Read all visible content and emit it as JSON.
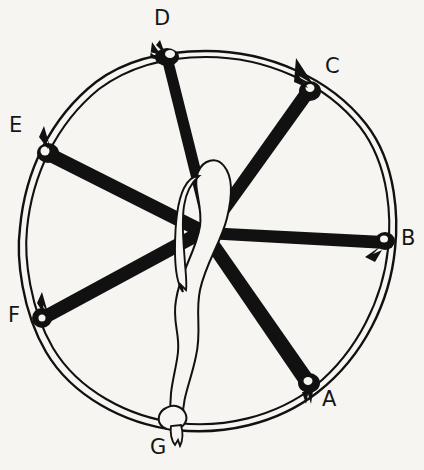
{
  "figure": {
    "title": "",
    "type": "line-diagram",
    "background_color": "#f6f5f1",
    "ink_color": "#111111",
    "width": 424,
    "height": 470
  },
  "hoop": {
    "name": "circular-hoop",
    "center": {
      "x": 206,
      "y": 241
    },
    "radius": 189,
    "stroke": "#111111",
    "style": "double-line (rope)"
  },
  "center_junction": {
    "x": 207,
    "y": 228
  },
  "labels": [
    {
      "id": "A",
      "text": "A",
      "x": 322,
      "y": 396,
      "anchor": {
        "x": 309,
        "y": 384
      }
    },
    {
      "id": "B",
      "text": "B",
      "x": 401,
      "y": 232,
      "anchor": {
        "x": 385,
        "y": 242
      }
    },
    {
      "id": "C",
      "text": "C",
      "x": 325,
      "y": 60,
      "anchor": {
        "x": 309,
        "y": 90
      }
    },
    {
      "id": "D",
      "text": "D",
      "x": 155,
      "y": 10,
      "anchor": {
        "x": 166,
        "y": 55
      }
    },
    {
      "id": "E",
      "text": "E",
      "x": 10,
      "y": 118,
      "anchor": {
        "x": 48,
        "y": 152
      }
    },
    {
      "id": "F",
      "text": "F",
      "x": 8,
      "y": 308,
      "anchor": {
        "x": 43,
        "y": 318
      }
    },
    {
      "id": "G",
      "text": "G",
      "x": 150,
      "y": 440,
      "anchor": {
        "x": 176,
        "y": 420
      }
    }
  ],
  "cords": [
    {
      "id": "cord-A",
      "label": "A",
      "from_label_point": {
        "x": 309,
        "y": 384
      },
      "to_center": {
        "x": 207,
        "y": 228
      },
      "color": "#111111",
      "fill": "solid-black",
      "thickness": "thick"
    },
    {
      "id": "cord-B",
      "label": "B",
      "from_label_point": {
        "x": 385,
        "y": 242
      },
      "to_center": {
        "x": 207,
        "y": 228
      },
      "color": "#111111",
      "fill": "solid-black",
      "thickness": "thick"
    },
    {
      "id": "cord-C",
      "label": "C",
      "from_label_point": {
        "x": 309,
        "y": 90
      },
      "to_center": {
        "x": 207,
        "y": 228
      },
      "color": "#111111",
      "fill": "solid-black",
      "thickness": "thick"
    },
    {
      "id": "cord-D",
      "label": "D",
      "from_label_point": {
        "x": 166,
        "y": 55
      },
      "to_center": {
        "x": 207,
        "y": 228
      },
      "color": "#111111",
      "fill": "solid-black",
      "thickness": "thick"
    },
    {
      "id": "cord-E",
      "label": "E",
      "from_label_point": {
        "x": 48,
        "y": 152
      },
      "to_center": {
        "x": 207,
        "y": 228
      },
      "color": "#111111",
      "fill": "solid-black",
      "thickness": "thick"
    },
    {
      "id": "cord-F",
      "label": "F",
      "from_label_point": {
        "x": 43,
        "y": 318
      },
      "to_center": {
        "x": 207,
        "y": 228
      },
      "color": "#111111",
      "fill": "solid-black",
      "thickness": "thick"
    },
    {
      "id": "cord-G",
      "label": "G",
      "from_label_point": {
        "x": 176,
        "y": 420
      },
      "to_center": {
        "x": 207,
        "y": 228
      },
      "color": "#111111",
      "fill": "white-outline",
      "thickness": "thin",
      "shape": "long loop doubling back on itself through the centre"
    }
  ],
  "knots": [
    {
      "id": "knot-A",
      "x": 309,
      "y": 384
    },
    {
      "id": "knot-B",
      "x": 385,
      "y": 242
    },
    {
      "id": "knot-C",
      "x": 309,
      "y": 90
    },
    {
      "id": "knot-D",
      "x": 166,
      "y": 55
    },
    {
      "id": "knot-E",
      "x": 48,
      "y": 152
    },
    {
      "id": "knot-F",
      "x": 43,
      "y": 318
    },
    {
      "id": "knot-G",
      "x": 176,
      "y": 420
    }
  ]
}
